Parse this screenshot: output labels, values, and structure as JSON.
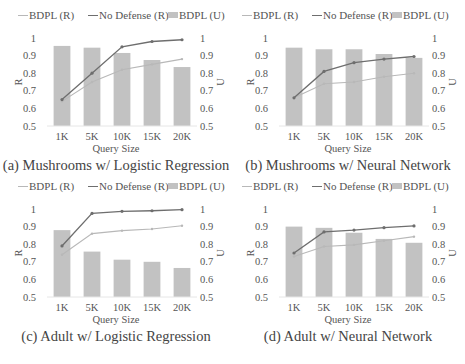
{
  "legend": {
    "bdpl_r": "BDPL (R)",
    "no_defense_r": "No Defense (R)",
    "bdpl_u": "BDPL (U)"
  },
  "colors": {
    "bar": "#c2c2c2",
    "bdpl_line": "#b8b8b8",
    "no_defense_line": "#6e6e6e",
    "text": "#555555"
  },
  "chart_data": [
    {
      "type": "bar+line",
      "title": "(a) Mushrooms w/ Logistic Regression",
      "xlabel": "Query Size",
      "ylabel": "R",
      "y2label": "U",
      "categories": [
        "1K",
        "5K",
        "10K",
        "15K",
        "20K"
      ],
      "ylim": [
        0.5,
        1
      ],
      "y2lim": [
        0.5,
        1
      ],
      "yticks": [
        "0.5",
        "0.6",
        "0.7",
        "0.8",
        "0.9",
        "1"
      ],
      "series": [
        {
          "name": "BDPL (R)",
          "type": "line",
          "axis": "left",
          "values": [
            0.64,
            0.75,
            0.82,
            0.85,
            0.88
          ]
        },
        {
          "name": "No Defense (R)",
          "type": "line",
          "axis": "left",
          "values": [
            0.65,
            0.8,
            0.95,
            0.98,
            0.99
          ]
        },
        {
          "name": "BDPL (U)",
          "type": "bar",
          "axis": "right",
          "values": [
            0.955,
            0.945,
            0.915,
            0.875,
            0.835
          ]
        }
      ],
      "legend_position": "top",
      "grid": false
    },
    {
      "type": "bar+line",
      "title": "(b) Mushrooms w/ Neural Network",
      "xlabel": "Query Size",
      "ylabel": "R",
      "y2label": "U",
      "categories": [
        "1K",
        "5K",
        "10K",
        "15K",
        "20K"
      ],
      "ylim": [
        0.5,
        1
      ],
      "y2lim": [
        0.5,
        1
      ],
      "yticks": [
        "0.5",
        "0.6",
        "0.7",
        "0.8",
        "0.9",
        "1"
      ],
      "series": [
        {
          "name": "BDPL (R)",
          "type": "line",
          "axis": "left",
          "values": [
            0.66,
            0.74,
            0.75,
            0.78,
            0.8
          ]
        },
        {
          "name": "No Defense (R)",
          "type": "line",
          "axis": "left",
          "values": [
            0.66,
            0.81,
            0.86,
            0.88,
            0.895
          ]
        },
        {
          "name": "BDPL (U)",
          "type": "bar",
          "axis": "right",
          "values": [
            0.945,
            0.936,
            0.936,
            0.909,
            0.887
          ]
        }
      ],
      "legend_position": "top",
      "grid": false
    },
    {
      "type": "bar+line",
      "title": "(c) Adult w/ Logistic Regression",
      "xlabel": "Query Size",
      "ylabel": "R",
      "y2label": "U",
      "categories": [
        "1K",
        "5K",
        "10K",
        "15K",
        "20K"
      ],
      "ylim": [
        0.5,
        1
      ],
      "y2lim": [
        0.5,
        1
      ],
      "yticks": [
        "0.5",
        "0.6",
        "0.7",
        "0.8",
        "0.9",
        "1"
      ],
      "series": [
        {
          "name": "BDPL (R)",
          "type": "line",
          "axis": "left",
          "values": [
            0.74,
            0.86,
            0.877,
            0.886,
            0.905
          ]
        },
        {
          "name": "No Defense (R)",
          "type": "line",
          "axis": "left",
          "values": [
            0.79,
            0.975,
            0.987,
            0.99,
            0.996
          ]
        },
        {
          "name": "BDPL (U)",
          "type": "bar",
          "axis": "right",
          "values": [
            0.88,
            0.758,
            0.712,
            0.7,
            0.665
          ]
        }
      ],
      "legend_position": "top",
      "grid": false
    },
    {
      "type": "bar+line",
      "title": "(d) Adult w/ Neural Network",
      "xlabel": "Query Size",
      "ylabel": "R",
      "y2label": "U",
      "categories": [
        "1K",
        "5K",
        "10K",
        "15K",
        "20K"
      ],
      "ylim": [
        0.5,
        1
      ],
      "y2lim": [
        0.5,
        1
      ],
      "yticks": [
        "0.5",
        "0.6",
        "0.7",
        "0.8",
        "0.9",
        "1"
      ],
      "series": [
        {
          "name": "BDPL (R)",
          "type": "line",
          "axis": "left",
          "values": [
            0.73,
            0.787,
            0.796,
            0.82,
            0.843
          ]
        },
        {
          "name": "No Defense (R)",
          "type": "line",
          "axis": "left",
          "values": [
            0.75,
            0.87,
            0.88,
            0.894,
            0.904
          ]
        },
        {
          "name": "BDPL (U)",
          "type": "bar",
          "axis": "right",
          "values": [
            0.9,
            0.893,
            0.865,
            0.83,
            0.808
          ]
        }
      ],
      "legend_position": "top",
      "grid": false
    }
  ]
}
